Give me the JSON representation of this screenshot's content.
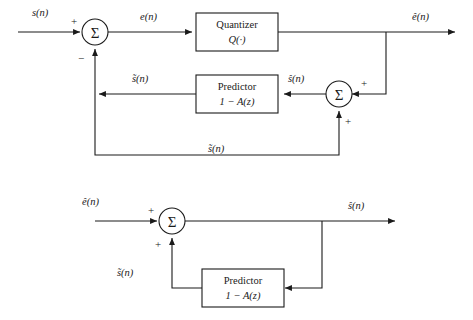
{
  "figure": {
    "type": "block-diagram",
    "title": "",
    "background_color": "#ffffff",
    "line_color": "#1a1a1a"
  },
  "upper_diagram": {
    "name": "dpcm-encoder",
    "input_label": "s(n)",
    "sum_node": {
      "glyph": "Σ",
      "sign_left": "+",
      "sign_bottom": "−"
    },
    "error_label": "e(n)",
    "quantizer": {
      "line1": "Quantizer",
      "line2": "Q(·)"
    },
    "output_label": "ê(n)",
    "predictor": {
      "line1": "Predictor",
      "line2": "1 − A(z)"
    },
    "predictor_output_label": "s̃(n)",
    "recon_sum_node": {
      "glyph": "Σ",
      "sign_right": "+",
      "sign_bottom": "+"
    },
    "recon_label": "ŝ(n)",
    "feedback_label": "s̃(n)"
  },
  "lower_diagram": {
    "name": "dpcm-decoder",
    "input_label": "ê(n)",
    "sum_node": {
      "glyph": "Σ",
      "sign_left": "+",
      "sign_bottom": "+"
    },
    "output_label": "ŝ(n)",
    "predictor": {
      "line1": "Predictor",
      "line2": "1 − A(z)"
    },
    "predictor_output_label": "s̃(n)"
  }
}
